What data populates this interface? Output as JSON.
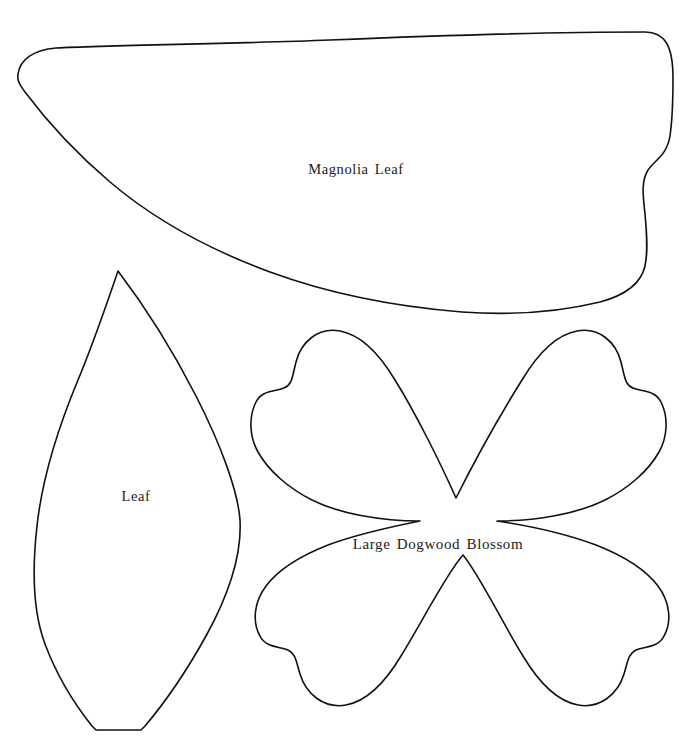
{
  "sheet": {
    "title": "Pattern Template Sheet",
    "background_color": "#ffffff",
    "outline_color": "#111111",
    "width": 687,
    "height": 753
  },
  "shapes": [
    {
      "id": "magnolia-leaf",
      "label": "Magnolia Leaf",
      "label_x": 356,
      "label_y": 169,
      "kind": "leaf-outline",
      "bounds": {
        "x": 16,
        "y": 30,
        "width": 658,
        "height": 288
      }
    },
    {
      "id": "leaf",
      "label": "Leaf",
      "label_x": 136,
      "label_y": 496,
      "kind": "pointed-leaf-outline",
      "bounds": {
        "x": 34,
        "y": 269,
        "width": 208,
        "height": 463
      }
    },
    {
      "id": "large-dogwood-blossom",
      "label": "Large Dogwood Blossom",
      "label_x": 438,
      "label_y": 544,
      "kind": "four-petal-blossom-outline",
      "bounds": {
        "x": 248,
        "y": 328,
        "width": 406,
        "height": 388
      },
      "petal_count": 4
    }
  ]
}
